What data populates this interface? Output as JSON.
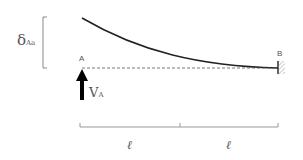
{
  "diagram": {
    "type": "cantilever-beam-deflection",
    "labels": {
      "deflection_symbol": "δ",
      "deflection_subscript": "Aa",
      "point_a": "A",
      "point_b": "B",
      "reaction_symbol": "V",
      "reaction_subscript": "A",
      "span_left": "ℓ",
      "span_right": "ℓ"
    },
    "colors": {
      "beam_curve": "#222222",
      "dashed_line": "#555555",
      "arrow": "#000000",
      "dimension_line": "#888888",
      "bracket": "#888888",
      "text": "#555555",
      "support_hatch": "#999999"
    }
  }
}
